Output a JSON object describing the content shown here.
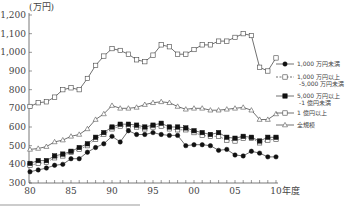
{
  "chart_data": {
    "type": "line",
    "title": "",
    "xlabel": "年度",
    "ylabel": "(万円)",
    "ylim": [
      300,
      1200
    ],
    "yticks": [
      300,
      400,
      500,
      600,
      700,
      800,
      900,
      1000,
      1100,
      1200
    ],
    "ytick_labels": [
      "300",
      "400",
      "500",
      "600",
      "700",
      "800",
      "900",
      "1,000",
      "1,100",
      "1,200"
    ],
    "x": [
      1980,
      1981,
      1982,
      1983,
      1984,
      1985,
      1986,
      1987,
      1988,
      1989,
      1990,
      1991,
      1992,
      1993,
      1994,
      1995,
      1996,
      1997,
      1998,
      1999,
      2000,
      2001,
      2002,
      2003,
      2004,
      2005,
      2006,
      2007,
      2008,
      2009,
      2010
    ],
    "xtick_labels": [
      "80",
      "85",
      "90",
      "95",
      "00",
      "05",
      "10"
    ],
    "xtick_years": [
      1980,
      1985,
      1990,
      1995,
      2000,
      2005,
      2010
    ],
    "x_suffix": "年度",
    "grid": false,
    "legend_position": "right",
    "series": [
      {
        "name": "1,000 万円未満",
        "marker": "filled-circle",
        "line": "solid",
        "values": [
          360,
          370,
          380,
          395,
          400,
          430,
          430,
          465,
          490,
          510,
          550,
          520,
          580,
          560,
          560,
          570,
          560,
          555,
          555,
          500,
          505,
          505,
          500,
          475,
          480,
          450,
          445,
          470,
          460,
          440,
          440
        ]
      },
      {
        "name": "1,000 万円以上 -5,000 万円未満",
        "marker": "open-square",
        "line": "dashed",
        "values": [
          395,
          405,
          410,
          435,
          445,
          465,
          480,
          500,
          535,
          560,
          590,
          605,
          605,
          600,
          590,
          600,
          605,
          590,
          585,
          585,
          570,
          555,
          550,
          550,
          530,
          525,
          540,
          540,
          515,
          530,
          535
        ]
      },
      {
        "name": "5,000 万円以上 -1 億円未満",
        "marker": "filled-square",
        "line": "solid",
        "values": [
          405,
          420,
          420,
          445,
          455,
          470,
          490,
          510,
          545,
          570,
          600,
          615,
          615,
          610,
          600,
          610,
          620,
          600,
          600,
          595,
          580,
          570,
          560,
          570,
          545,
          540,
          550,
          545,
          525,
          545,
          545
        ]
      },
      {
        "name": "1 億円以上",
        "marker": "open-square",
        "line": "solid",
        "values": [
          710,
          730,
          735,
          760,
          800,
          810,
          800,
          860,
          930,
          980,
          1020,
          1010,
          990,
          960,
          950,
          985,
          1040,
          1030,
          990,
          990,
          1015,
          1040,
          1040,
          1060,
          1060,
          1080,
          1100,
          1090,
          920,
          900,
          970
        ]
      },
      {
        "name": "全規模",
        "marker": "open-triangle",
        "line": "solid",
        "values": [
          480,
          485,
          495,
          520,
          530,
          550,
          560,
          590,
          640,
          670,
          715,
          700,
          700,
          705,
          720,
          730,
          735,
          730,
          710,
          695,
          700,
          700,
          690,
          690,
          695,
          700,
          705,
          690,
          640,
          640,
          670
        ]
      }
    ]
  },
  "legend": [
    {
      "line1": "1,000 万円未満",
      "line2": ""
    },
    {
      "line1": "1,000 万円以上",
      "line2": "-5,000 万円未満"
    },
    {
      "line1": "5,000 万円以上",
      "line2": "-1 億円未満"
    },
    {
      "line1": "1 億円以上",
      "line2": ""
    },
    {
      "line1": "全規模",
      "line2": ""
    }
  ],
  "unit_label": "(万円)",
  "x_axis_suffix": "年度"
}
